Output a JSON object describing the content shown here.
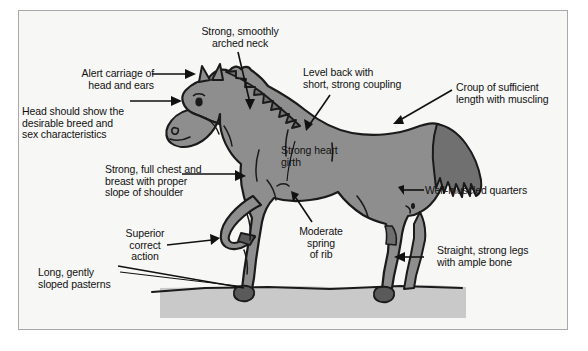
{
  "figure": {
    "background_color": "#f7f7f5",
    "frame_color": "#a9a9a9",
    "body_fill": "#8e8e8e",
    "mane_tail_fill": "#707070",
    "hoof_fill": "#5a5a5a",
    "ground_fill": "#c9c9c9",
    "outline_color": "#1a1a1a",
    "text_color": "#111111"
  },
  "labels": {
    "arched_neck": "Strong, smoothly\narched neck",
    "alert_carriage": "Alert carriage of\nhead and ears",
    "head_breed": "Head should show the\ndesirable breed and\nsex characteristics",
    "level_back": "Level back with\nshort, strong coupling",
    "croup": "Croup of sufficient\nlength with muscling",
    "heart_girth": "Strong heart\ngirth",
    "chest_breast": "Strong, full chest and\nbreast with proper\nslope of shoulder",
    "well_muscled_quarters": "Well-muscled quarters",
    "spring_of_rib": "Moderate\nspring\nof rib",
    "superior_action": "Superior\ncorrect\naction",
    "straight_legs": "Straight, strong legs\nwith ample bone",
    "sloped_pasterns": "Long, gently\nsloped pasterns"
  }
}
